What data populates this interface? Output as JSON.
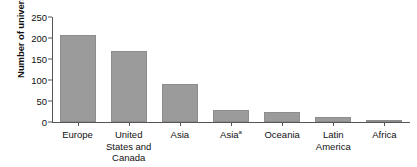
{
  "chart_data": {
    "type": "bar",
    "title": "",
    "xlabel": "",
    "ylabel": "Number of universities",
    "categories": [
      "Europe",
      "United States and Canada",
      "Asia",
      "Asia",
      "Oceania",
      "Latin America",
      "Africa"
    ],
    "category_lines": [
      [
        "Europe"
      ],
      [
        "United",
        "States and",
        "Canada"
      ],
      [
        "Asia"
      ],
      [
        "Asia"
      ],
      [
        "Oceania"
      ],
      [
        "Latin",
        "America"
      ],
      [
        "Africa"
      ]
    ],
    "category_footnotes": [
      "",
      "",
      "",
      "a",
      "",
      "",
      ""
    ],
    "values": [
      207,
      168,
      90,
      28,
      24,
      12,
      5
    ],
    "ylim": [
      0,
      250
    ],
    "yticks": [
      0,
      50,
      100,
      150,
      200,
      250
    ],
    "ytick_labels": [
      "0",
      "50",
      "100",
      "150",
      "200",
      "250"
    ],
    "grid": false,
    "legend": false,
    "bar_color": "#9b9b9b",
    "axis_color": "#555555",
    "text_color": "#111111",
    "background": "#ffffff"
  }
}
